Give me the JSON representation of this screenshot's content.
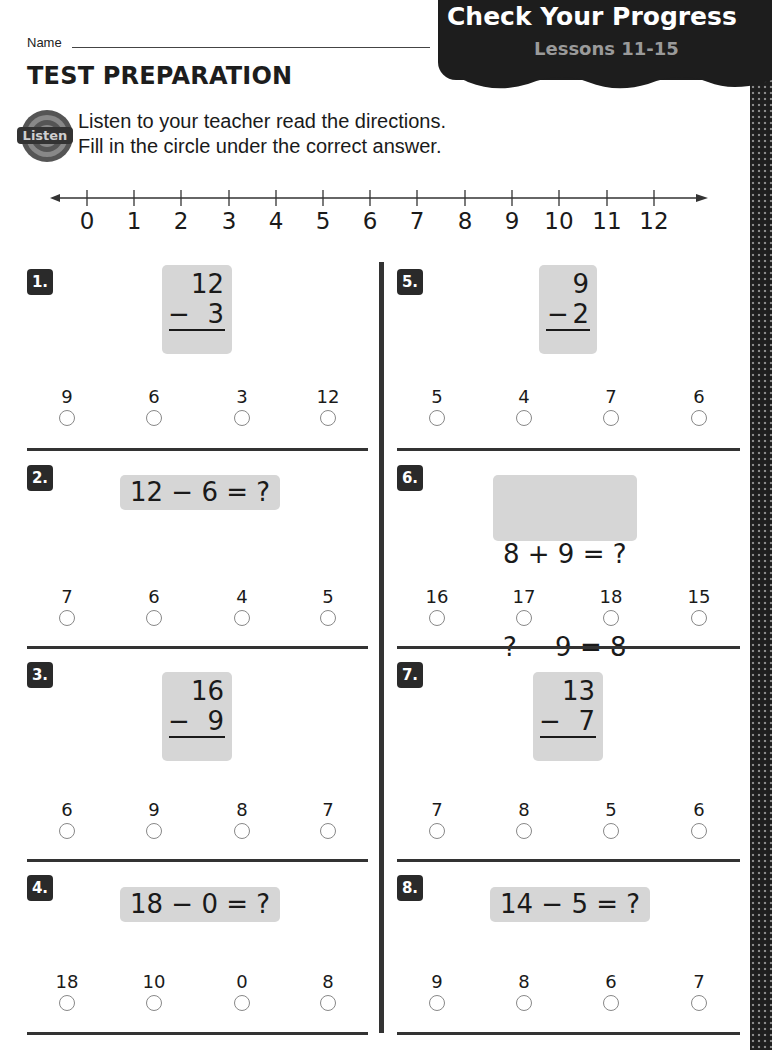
{
  "header": {
    "banner_title": "Check Your Progress",
    "banner_subtitle": "Lessons 11-15",
    "name_label": "Name",
    "section_title": "TEST PREPARATION",
    "listen_icon_label": "Listen",
    "directions_line1": "Listen to your teacher read the directions.",
    "directions_line2": "Fill in the circle under the correct answer."
  },
  "number_line": {
    "ticks": [
      "0",
      "1",
      "2",
      "3",
      "4",
      "5",
      "6",
      "7",
      "8",
      "9",
      "10",
      "11",
      "12"
    ]
  },
  "problems": [
    {
      "number": "1.",
      "type": "vertical",
      "top": "12",
      "op": "−",
      "bottom": "3",
      "choices": [
        "9",
        "6",
        "3",
        "12"
      ]
    },
    {
      "number": "2.",
      "type": "horizontal",
      "expr": "12 − 6 = ?",
      "choices": [
        "7",
        "6",
        "4",
        "5"
      ]
    },
    {
      "number": "3.",
      "type": "vertical",
      "top": "16",
      "op": "−",
      "bottom": "9",
      "choices": [
        "6",
        "9",
        "8",
        "7"
      ]
    },
    {
      "number": "4.",
      "type": "horizontal",
      "expr": "18 − 0 = ?",
      "choices": [
        "18",
        "10",
        "0",
        "8"
      ]
    },
    {
      "number": "5.",
      "type": "vertical",
      "top": "9",
      "op": "−",
      "bottom": "2",
      "choices": [
        "5",
        "4",
        "7",
        "6"
      ]
    },
    {
      "number": "6.",
      "type": "horizontal2",
      "expr_line1": "8 + 9 = ?",
      "expr_line2": "? − 9 = 8",
      "choices": [
        "16",
        "17",
        "18",
        "15"
      ]
    },
    {
      "number": "7.",
      "type": "vertical",
      "top": "13",
      "op": "−",
      "bottom": "7",
      "choices": [
        "7",
        "8",
        "5",
        "6"
      ]
    },
    {
      "number": "8.",
      "type": "horizontal",
      "expr": "14 − 5 = ?",
      "choices": [
        "9",
        "8",
        "6",
        "7"
      ]
    }
  ]
}
